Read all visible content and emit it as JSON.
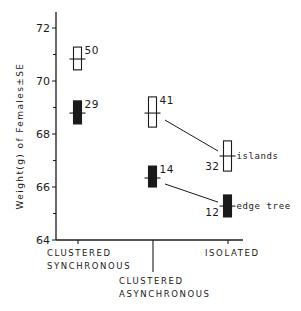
{
  "chart_data": {
    "type": "scatter",
    "title": "",
    "xlabel": "",
    "ylabel": "Weight(g) of Females±SE",
    "ylim": [
      64,
      72.6
    ],
    "yticks": [
      64,
      66,
      68,
      70,
      72
    ],
    "grid": false,
    "categories": [
      "CLUSTERED SYNCHRONOUS",
      "CLUSTERED ASYNCHRONOUS",
      "ISOLATED"
    ],
    "category_lines": [
      [
        "CLUSTERED",
        "SYNCHRONOUS"
      ],
      [
        "CLUSTERED",
        "ASYNCHRONOUS"
      ],
      [
        "ISOLATED"
      ]
    ],
    "series": [
      {
        "name": "islands",
        "marker": "open-box",
        "values": [
          70.83,
          68.79,
          67.17
        ],
        "se_high": [
          71.28,
          69.4,
          67.74
        ],
        "se_low": [
          70.42,
          68.26,
          66.6
        ],
        "n": [
          50,
          41,
          32
        ]
      },
      {
        "name": "edge tree",
        "marker": "filled-box",
        "values": [
          68.79,
          66.34,
          65.28
        ],
        "se_high": [
          69.25,
          66.79,
          65.7
        ],
        "se_low": [
          68.38,
          66.0,
          64.87
        ],
        "n": [
          29,
          14,
          12
        ]
      }
    ],
    "connectors": [
      {
        "series": "islands",
        "from": "CLUSTERED ASYNCHRONOUS",
        "to": "ISOLATED"
      },
      {
        "series": "edge tree",
        "from": "CLUSTERED ASYNCHRONOUS",
        "to": "ISOLATED"
      }
    ],
    "annotations": [
      "islands",
      "edge tree"
    ]
  },
  "colors": {
    "ink": "#1a1a1a",
    "background": "#ffffff"
  }
}
